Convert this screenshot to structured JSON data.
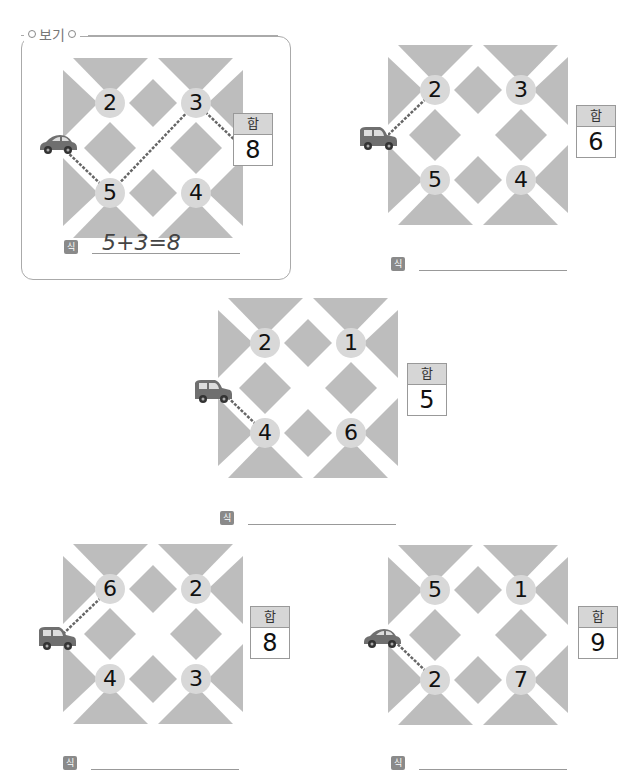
{
  "example": {
    "legend_label": "보기"
  },
  "labels": {
    "sum_header": "합",
    "equation_badge": "식"
  },
  "puzzles": [
    {
      "id": "example",
      "numbers": {
        "top_left": "2",
        "top_right": "3",
        "bottom_left": "5",
        "bottom_right": "4"
      },
      "sum": "8",
      "equation": "5+3=8",
      "car_type": "sedan",
      "path": [
        "car",
        "bottom_left",
        "top_right",
        "sum"
      ]
    },
    {
      "id": "puzzle-1",
      "numbers": {
        "top_left": "2",
        "top_right": "3",
        "bottom_left": "5",
        "bottom_right": "4"
      },
      "sum": "6",
      "equation": "",
      "car_type": "van",
      "path": [
        "car",
        "top_left"
      ]
    },
    {
      "id": "puzzle-2",
      "numbers": {
        "top_left": "2",
        "top_right": "1",
        "bottom_left": "4",
        "bottom_right": "6"
      },
      "sum": "5",
      "equation": "",
      "car_type": "van",
      "path": [
        "car",
        "bottom_left"
      ]
    },
    {
      "id": "puzzle-3",
      "numbers": {
        "top_left": "6",
        "top_right": "2",
        "bottom_left": "4",
        "bottom_right": "3"
      },
      "sum": "8",
      "equation": "",
      "car_type": "van",
      "path": [
        "car",
        "top_left"
      ]
    },
    {
      "id": "puzzle-4",
      "numbers": {
        "top_left": "5",
        "top_right": "1",
        "bottom_left": "2",
        "bottom_right": "7"
      },
      "sum": "9",
      "equation": "",
      "car_type": "sedan",
      "path": [
        "car",
        "bottom_left"
      ]
    }
  ],
  "colors": {
    "block": "#bdbdbd",
    "road": "#ffffff",
    "number_circle": "#d8d8d8",
    "sum_header": "#d6d6d6",
    "badge": "#8a8a8a",
    "car": "#6f6f6f"
  }
}
